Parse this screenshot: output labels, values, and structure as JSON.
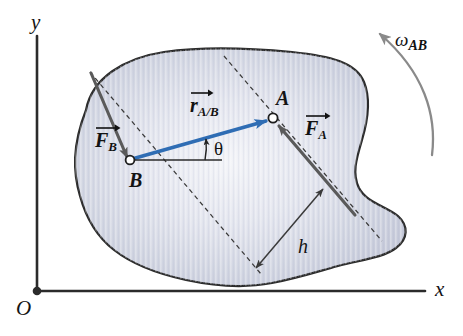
{
  "figure": {
    "background": "#ffffff",
    "width": 463,
    "height": 336
  },
  "colors": {
    "body_fill_light": "#eef0f5",
    "body_fill_mid": "#ccd0dd",
    "body_outline": "#2b2b2b",
    "force_vector": "#5a5a5a",
    "position_vector": "#2f6db4",
    "axis": "#2b2b2b",
    "dashed_line": "#3a3a3a",
    "omega_arc": "#8a8a8a",
    "label_text": "#141414"
  },
  "axes": {
    "y_label": "y",
    "x_label": "x",
    "origin_label": "O",
    "origin_marker": "filled-dot"
  },
  "points": [
    {
      "id": "A",
      "label": "A",
      "marker": "open-circle",
      "x": 273,
      "y": 118
    },
    {
      "id": "B",
      "label": "B",
      "marker": "open-circle",
      "x": 130,
      "y": 160
    }
  ],
  "vectors": [
    {
      "id": "F_A",
      "symbol": "F",
      "subscript": "A",
      "label_text": "F_A",
      "kind": "force",
      "color": "#5a5a5a",
      "head_at": "A",
      "description": "force applied at point A pointing up-left"
    },
    {
      "id": "F_B",
      "symbol": "F",
      "subscript": "B",
      "label_text": "F_B",
      "kind": "force",
      "color": "#5a5a5a",
      "head_at": "B",
      "description": "force applied at point B pointing down-right"
    },
    {
      "id": "r_A/B",
      "symbol": "r",
      "subscript": "A/B",
      "label_text": "r_A/B",
      "kind": "position",
      "color": "#2f6db4",
      "tail_at": "B",
      "head_at": "A",
      "description": "position vector of A relative to B"
    }
  ],
  "angles": [
    {
      "id": "theta",
      "label": "θ",
      "between": "horizontal reference line at B and r_A/B"
    }
  ],
  "dimensions": [
    {
      "id": "h",
      "label": "h",
      "style": "double-headed-arrow",
      "description": "perpendicular distance between the two dashed force lines of action"
    }
  ],
  "rotation": {
    "id": "omega_AB",
    "symbol": "ω",
    "subscript": "AB",
    "label_text": "ω_AB",
    "arc_direction": "counterclockwise",
    "arrowhead": "top"
  }
}
